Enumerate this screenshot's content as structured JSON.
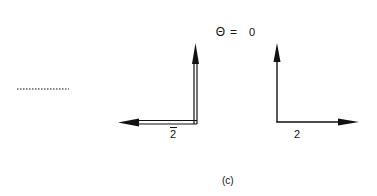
{
  "title": {
    "symbol": "Θ",
    "equals": "=",
    "value": "0"
  },
  "left_figure": {
    "label": "2",
    "label_overbar": true,
    "line_style": "double",
    "arrows": [
      "up",
      "left"
    ]
  },
  "right_figure": {
    "label": "2",
    "line_style": "single",
    "arrows": [
      "up",
      "right"
    ]
  },
  "dotted_line": {
    "style": "dotted"
  },
  "caption": "(c)",
  "colors": {
    "ink": "#111111",
    "background": "#ffffff"
  }
}
